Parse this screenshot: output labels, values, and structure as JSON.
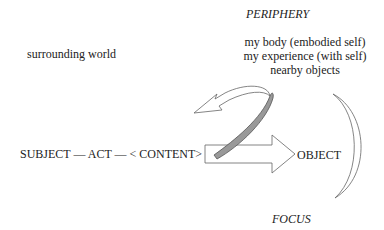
{
  "diagram": {
    "periphery_label": "PERIPHERY",
    "focus_label": "FOCUS",
    "surrounding": "surrounding world",
    "periphery_items": [
      "my body (embodied self)",
      "my experience (with self)",
      "nearby objects"
    ],
    "main_line": "SUBJECT — ACT — < CONTENT>",
    "object_label": "OBJECT",
    "colors": {
      "text": "#222222",
      "outline": "#555555",
      "band_fill": "#999999"
    }
  }
}
